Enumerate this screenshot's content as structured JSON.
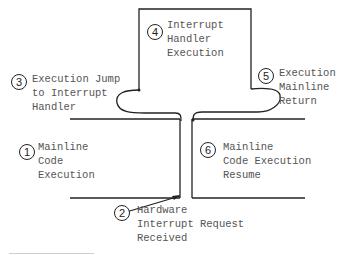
{
  "diagram": {
    "steps": [
      {
        "number": "1",
        "lines": [
          "Mainline",
          "Code",
          "Execution"
        ]
      },
      {
        "number": "2",
        "lines": [
          "Hardware",
          "Interrupt Request",
          "Received"
        ]
      },
      {
        "number": "3",
        "lines": [
          "Execution Jump",
          "to Interrupt",
          "Handler"
        ]
      },
      {
        "number": "4",
        "lines": [
          "Interrupt",
          "Handler",
          "Execution"
        ]
      },
      {
        "number": "5",
        "lines": [
          "Execution",
          "Mainline",
          "Return"
        ]
      },
      {
        "number": "6",
        "lines": [
          "Mainline",
          "Code Execution",
          "Resume"
        ]
      }
    ],
    "colors": {
      "line": "#222222",
      "text": "#555555"
    }
  }
}
